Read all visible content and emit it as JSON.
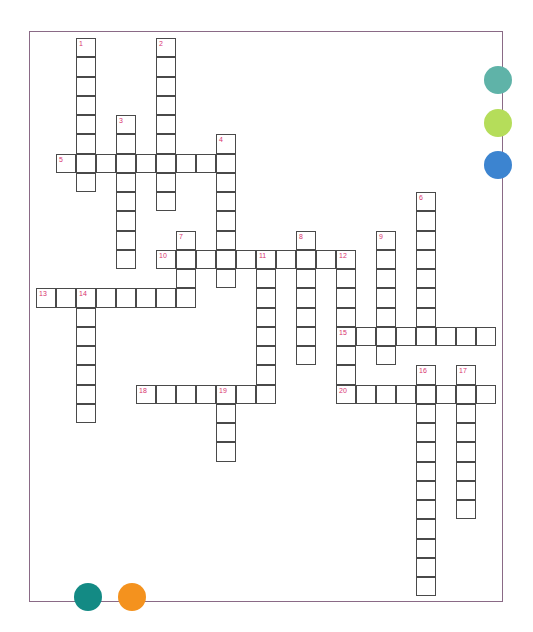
{
  "puzzle": {
    "type": "crossword",
    "cell_width": 20,
    "cell_height": 19.25,
    "origin_x": 36,
    "origin_y": 38,
    "entries": [
      {
        "number": "1",
        "direction": "down",
        "col": 2,
        "row": 0,
        "length": 8
      },
      {
        "number": "2",
        "direction": "down",
        "col": 6,
        "row": 0,
        "length": 9
      },
      {
        "number": "3",
        "direction": "down",
        "col": 4,
        "row": 4,
        "length": 8
      },
      {
        "number": "4",
        "direction": "down",
        "col": 9,
        "row": 5,
        "length": 8
      },
      {
        "number": "5",
        "direction": "across",
        "col": 1,
        "row": 6,
        "length": 9
      },
      {
        "number": "6",
        "direction": "down",
        "col": 19,
        "row": 8,
        "length": 8
      },
      {
        "number": "7",
        "direction": "down",
        "col": 7,
        "row": 10,
        "length": 4
      },
      {
        "number": "8",
        "direction": "down",
        "col": 13,
        "row": 10,
        "length": 7
      },
      {
        "number": "9",
        "direction": "down",
        "col": 17,
        "row": 10,
        "length": 7
      },
      {
        "number": "10",
        "direction": "across",
        "col": 6,
        "row": 11,
        "length": 10
      },
      {
        "number": "11",
        "direction": "down",
        "col": 11,
        "row": 11,
        "length": 8
      },
      {
        "number": "12",
        "direction": "down",
        "col": 15,
        "row": 11,
        "length": 8
      },
      {
        "number": "13",
        "direction": "across",
        "col": 0,
        "row": 13,
        "length": 8
      },
      {
        "number": "14",
        "direction": "down",
        "col": 2,
        "row": 13,
        "length": 7
      },
      {
        "number": "15",
        "direction": "across",
        "col": 15,
        "row": 15,
        "length": 8
      },
      {
        "number": "16",
        "direction": "down",
        "col": 19,
        "row": 17,
        "length": 12
      },
      {
        "number": "17",
        "direction": "down",
        "col": 21,
        "row": 17,
        "length": 8
      },
      {
        "number": "18",
        "direction": "across",
        "col": 5,
        "row": 18,
        "length": 7
      },
      {
        "number": "19",
        "direction": "down",
        "col": 9,
        "row": 18,
        "length": 4
      },
      {
        "number": "20",
        "direction": "across",
        "col": 15,
        "row": 18,
        "length": 8
      }
    ]
  },
  "colors": {
    "frame": "#8a6a86",
    "grid_line": "#4a4a4a",
    "number": "#d8336f"
  },
  "decorations": [
    {
      "name": "teal-dot",
      "x": 498,
      "y": 80,
      "r": 14,
      "color": "#5fb3a8"
    },
    {
      "name": "lime-dot",
      "x": 498,
      "y": 123,
      "r": 14,
      "color": "#b5dd5a"
    },
    {
      "name": "blue-dot",
      "x": 498,
      "y": 165,
      "r": 14,
      "color": "#3c84d0"
    },
    {
      "name": "dark-teal-dot",
      "x": 88,
      "y": 597,
      "r": 14,
      "color": "#138a84"
    },
    {
      "name": "orange-dot",
      "x": 132,
      "y": 597,
      "r": 14,
      "color": "#f4921e"
    }
  ]
}
